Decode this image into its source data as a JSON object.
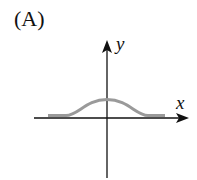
{
  "figure": {
    "label": "(A)",
    "x_axis_label": "x",
    "y_axis_label": "y",
    "curve_color": "#9a9a9a",
    "axis_color": "#111111"
  }
}
